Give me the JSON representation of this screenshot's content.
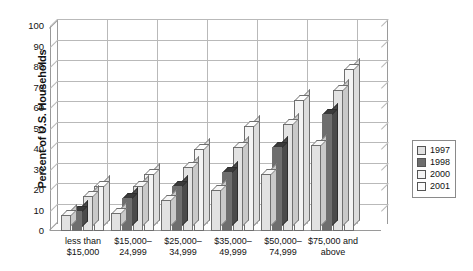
{
  "chart_data": {
    "type": "bar",
    "title": "",
    "xlabel": "",
    "ylabel": "Percent of U.S. Households",
    "ylim": [
      0,
      100
    ],
    "ytick_step": 10,
    "yticks": [
      "100",
      "90",
      "80",
      "70",
      "60",
      "50",
      "40",
      "30",
      "20",
      "10",
      "0"
    ],
    "grid": true,
    "legend_position": "right",
    "categories": [
      "less than\n$15,000",
      "$15,000–\n24,999",
      "$25,000–\n34,999",
      "$35,000–\n49,999",
      "$50,000–\n74,999",
      "$75,000 and\nabove"
    ],
    "series": [
      {
        "name": "1997",
        "color": "#e2e2e2",
        "values": [
          8,
          9,
          15,
          20,
          28,
          42
        ]
      },
      {
        "name": "1998",
        "color": "#6e6e6e",
        "values": [
          10,
          16,
          22,
          29,
          41,
          57
        ]
      },
      {
        "name": "2000",
        "color": "#f4f4f4",
        "values": [
          17,
          22,
          31,
          41,
          52,
          69
        ]
      },
      {
        "name": "2001",
        "color": "#fbfbfb",
        "values": [
          22,
          28,
          40,
          51,
          64,
          79
        ]
      }
    ]
  },
  "legend": {
    "items": [
      {
        "label": "1997"
      },
      {
        "label": "1998"
      },
      {
        "label": "2000"
      },
      {
        "label": "2001"
      }
    ]
  }
}
